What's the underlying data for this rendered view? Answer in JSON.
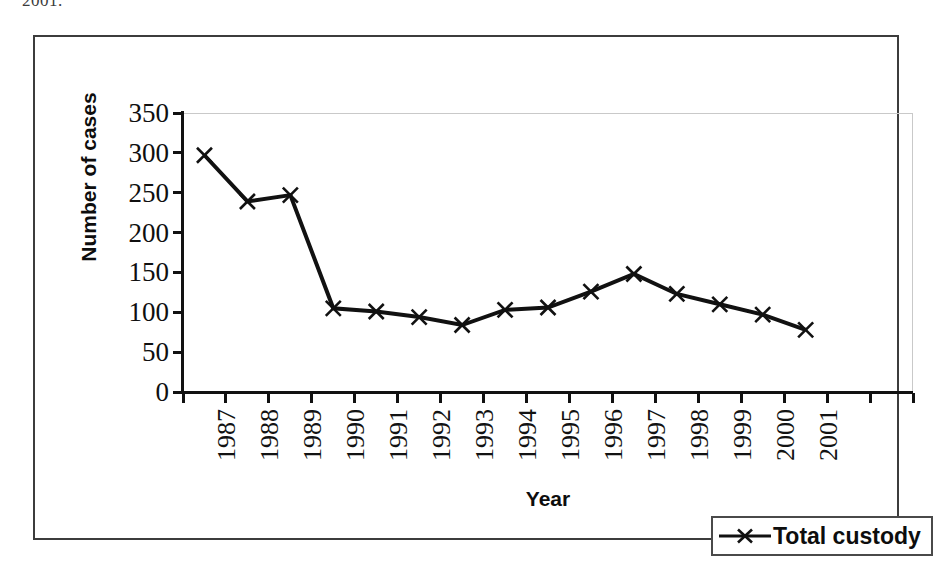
{
  "page": {
    "top_fragment": "2001."
  },
  "chart_data": {
    "type": "line",
    "title": "",
    "xlabel": "Year",
    "ylabel": "Number of cases",
    "categories": [
      "1987",
      "1988",
      "1989",
      "1990",
      "1991",
      "1992",
      "1993",
      "1994",
      "1995",
      "1996",
      "1997",
      "1998",
      "1999",
      "2000",
      "2001"
    ],
    "series": [
      {
        "name": "Total custody",
        "marker": "x",
        "color": "#111111",
        "values": [
          297,
          239,
          247,
          105,
          101,
          94,
          84,
          103,
          106,
          126,
          148,
          123,
          110,
          97,
          78
        ]
      }
    ],
    "ylim": [
      0,
      350
    ],
    "ytick_step": 50,
    "yticks": [
      "0",
      "50",
      "100",
      "150",
      "200",
      "250",
      "300",
      "350"
    ],
    "extra_unlabeled_x_ticks": 2,
    "grid": false,
    "legend_position": "bottom-right",
    "legend_entries": [
      "Total custody"
    ]
  }
}
